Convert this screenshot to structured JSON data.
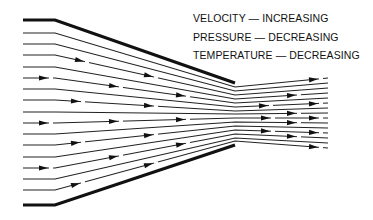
{
  "legend": {
    "items": [
      {
        "label": "VELOCITY — INCREASING"
      },
      {
        "label": "PRESSURE — DECREASING"
      },
      {
        "label": "TEMPERATURE — DECREASING"
      }
    ]
  },
  "nozzle": {
    "wall_color": "#111111",
    "line_color": "#222222",
    "inlet_x": 23,
    "bend_x": 55,
    "throat_x": 235,
    "outlet_x": 328,
    "top_wall": {
      "inlet_y": 20,
      "throat_y": 83
    },
    "bottom_wall": {
      "inlet_y": 205,
      "throat_y": 145
    },
    "streamline_count": 15,
    "inlet_ys": [
      33,
      44,
      55,
      67,
      78,
      89,
      100,
      112,
      123,
      134,
      145,
      157,
      168,
      179,
      190
    ],
    "throat_ys": [
      87,
      91,
      95,
      99,
      103,
      107,
      111,
      114,
      118,
      122,
      126,
      130,
      134,
      138,
      141
    ],
    "outlet_ys": [
      78,
      83,
      88,
      93,
      98,
      103,
      108,
      113,
      118,
      123,
      128,
      133,
      138,
      143,
      148
    ],
    "arrows": [
      {
        "line": 2,
        "x": 84
      },
      {
        "line": 2,
        "x": 153
      },
      {
        "line": 4,
        "x": 48
      },
      {
        "line": 4,
        "x": 118
      },
      {
        "line": 4,
        "x": 185
      },
      {
        "line": 6,
        "x": 80
      },
      {
        "line": 6,
        "x": 153
      },
      {
        "line": 8,
        "x": 48
      },
      {
        "line": 8,
        "x": 118
      },
      {
        "line": 8,
        "x": 185
      },
      {
        "line": 10,
        "x": 80
      },
      {
        "line": 10,
        "x": 153
      },
      {
        "line": 12,
        "x": 48
      },
      {
        "line": 12,
        "x": 118
      },
      {
        "line": 12,
        "x": 185
      },
      {
        "line": 14,
        "x": 80
      },
      {
        "line": 14,
        "x": 153
      },
      {
        "line": 0,
        "x": 318
      },
      {
        "line": 3,
        "x": 296
      },
      {
        "line": 5,
        "x": 268
      },
      {
        "line": 5,
        "x": 318
      },
      {
        "line": 7,
        "x": 296
      },
      {
        "line": 8,
        "x": 270
      },
      {
        "line": 8,
        "x": 318
      },
      {
        "line": 9,
        "x": 296
      },
      {
        "line": 11,
        "x": 270
      },
      {
        "line": 11,
        "x": 318
      },
      {
        "line": 12,
        "x": 296
      },
      {
        "line": 14,
        "x": 318
      }
    ]
  }
}
